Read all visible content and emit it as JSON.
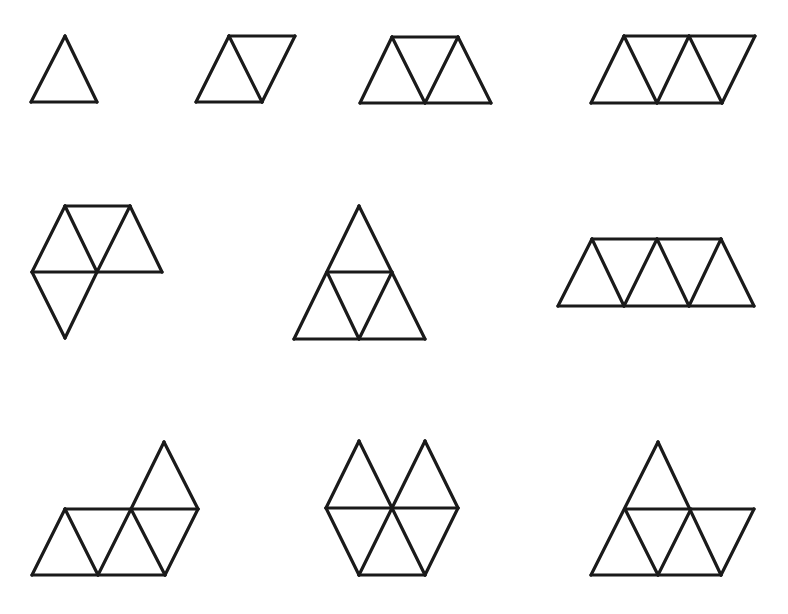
{
  "canvas": {
    "width": 788,
    "height": 614,
    "background": "#ffffff",
    "stroke_color": "#1a1a1a"
  },
  "figures": [
    {
      "id": "fig1",
      "label": "1 triangle (monoamond)",
      "triangles": 1,
      "segments": [
        [
          [
            65,
            36
          ],
          [
            97,
            102
          ]
        ],
        [
          [
            97,
            102
          ],
          [
            31,
            102
          ]
        ],
        [
          [
            31,
            102
          ],
          [
            65,
            36
          ]
        ]
      ]
    },
    {
      "id": "fig2",
      "label": "2 triangles (rhombus)",
      "triangles": 2,
      "segments": [
        [
          [
            229,
            36
          ],
          [
            295,
            36
          ]
        ],
        [
          [
            295,
            36
          ],
          [
            262,
            102
          ]
        ],
        [
          [
            262,
            102
          ],
          [
            196,
            102
          ]
        ],
        [
          [
            196,
            102
          ],
          [
            229,
            36
          ]
        ],
        [
          [
            229,
            36
          ],
          [
            262,
            102
          ]
        ]
      ]
    },
    {
      "id": "fig3",
      "label": "3 triangles (trapezoid)",
      "triangles": 3,
      "segments": [
        [
          [
            392,
            37
          ],
          [
            458,
            37
          ]
        ],
        [
          [
            360,
            103
          ],
          [
            491,
            103
          ]
        ],
        [
          [
            360,
            103
          ],
          [
            392,
            37
          ]
        ],
        [
          [
            392,
            37
          ],
          [
            425,
            103
          ]
        ],
        [
          [
            425,
            103
          ],
          [
            458,
            37
          ]
        ],
        [
          [
            458,
            37
          ],
          [
            491,
            103
          ]
        ]
      ]
    },
    {
      "id": "fig4",
      "label": "4 triangles (parallelogram)",
      "triangles": 4,
      "segments": [
        [
          [
            624,
            36
          ],
          [
            755,
            36
          ]
        ],
        [
          [
            591,
            103
          ],
          [
            722,
            103
          ]
        ],
        [
          [
            591,
            103
          ],
          [
            624,
            36
          ]
        ],
        [
          [
            624,
            36
          ],
          [
            657,
            103
          ]
        ],
        [
          [
            657,
            103
          ],
          [
            689,
            36
          ]
        ],
        [
          [
            689,
            36
          ],
          [
            722,
            103
          ]
        ],
        [
          [
            722,
            103
          ],
          [
            755,
            36
          ]
        ]
      ]
    },
    {
      "id": "fig5",
      "label": "4 triangles (bent)",
      "triangles": 4,
      "segments": [
        [
          [
            65,
            206
          ],
          [
            130,
            206
          ]
        ],
        [
          [
            32,
            272
          ],
          [
            162,
            272
          ]
        ],
        [
          [
            32,
            272
          ],
          [
            65,
            206
          ]
        ],
        [
          [
            65,
            206
          ],
          [
            97,
            272
          ]
        ],
        [
          [
            97,
            272
          ],
          [
            130,
            206
          ]
        ],
        [
          [
            130,
            206
          ],
          [
            162,
            272
          ]
        ],
        [
          [
            32,
            272
          ],
          [
            65,
            338
          ]
        ],
        [
          [
            65,
            338
          ],
          [
            97,
            272
          ]
        ]
      ]
    },
    {
      "id": "fig6",
      "label": "4 triangles (large triangle)",
      "triangles": 4,
      "segments": [
        [
          [
            359,
            206
          ],
          [
            294,
            339
          ]
        ],
        [
          [
            359,
            206
          ],
          [
            425,
            339
          ]
        ],
        [
          [
            294,
            339
          ],
          [
            425,
            339
          ]
        ],
        [
          [
            327,
            272
          ],
          [
            392,
            272
          ]
        ],
        [
          [
            327,
            272
          ],
          [
            359,
            339
          ]
        ],
        [
          [
            359,
            339
          ],
          [
            392,
            272
          ]
        ]
      ]
    },
    {
      "id": "fig7",
      "label": "5 triangles (long trapezoid)",
      "triangles": 5,
      "segments": [
        [
          [
            592,
            239
          ],
          [
            721,
            239
          ]
        ],
        [
          [
            558,
            306
          ],
          [
            754,
            306
          ]
        ],
        [
          [
            558,
            306
          ],
          [
            592,
            239
          ]
        ],
        [
          [
            592,
            239
          ],
          [
            624,
            306
          ]
        ],
        [
          [
            624,
            306
          ],
          [
            657,
            239
          ]
        ],
        [
          [
            657,
            239
          ],
          [
            689,
            306
          ]
        ],
        [
          [
            689,
            306
          ],
          [
            721,
            239
          ]
        ],
        [
          [
            721,
            239
          ],
          [
            754,
            306
          ]
        ]
      ]
    },
    {
      "id": "fig8",
      "label": "5 triangles (stepped)",
      "triangles": 5,
      "segments": [
        [
          [
            65,
            509
          ],
          [
            198,
            509
          ]
        ],
        [
          [
            32,
            575
          ],
          [
            165,
            575
          ]
        ],
        [
          [
            32,
            575
          ],
          [
            65,
            509
          ]
        ],
        [
          [
            65,
            509
          ],
          [
            98,
            575
          ]
        ],
        [
          [
            98,
            575
          ],
          [
            131,
            509
          ]
        ],
        [
          [
            131,
            509
          ],
          [
            165,
            575
          ]
        ],
        [
          [
            165,
            575
          ],
          [
            198,
            509
          ]
        ],
        [
          [
            131,
            509
          ],
          [
            164,
            442
          ]
        ],
        [
          [
            164,
            442
          ],
          [
            198,
            509
          ]
        ]
      ]
    },
    {
      "id": "fig9",
      "label": "6 triangles (hexagon-like)",
      "triangles": 6,
      "segments": [
        [
          [
            359,
            441
          ],
          [
            326,
            508
          ]
        ],
        [
          [
            359,
            441
          ],
          [
            392,
            508
          ]
        ],
        [
          [
            425,
            441
          ],
          [
            392,
            508
          ]
        ],
        [
          [
            425,
            441
          ],
          [
            458,
            508
          ]
        ],
        [
          [
            326,
            508
          ],
          [
            458,
            508
          ]
        ],
        [
          [
            326,
            508
          ],
          [
            359,
            575
          ]
        ],
        [
          [
            359,
            575
          ],
          [
            425,
            575
          ]
        ],
        [
          [
            425,
            575
          ],
          [
            458,
            508
          ]
        ],
        [
          [
            359,
            575
          ],
          [
            392,
            508
          ]
        ],
        [
          [
            392,
            508
          ],
          [
            425,
            575
          ]
        ]
      ]
    },
    {
      "id": "fig10",
      "label": "5 triangles (triangle + extension)",
      "triangles": 5,
      "segments": [
        [
          [
            658,
            442
          ],
          [
            591,
            575
          ]
        ],
        [
          [
            658,
            442
          ],
          [
            721,
            575
          ]
        ],
        [
          [
            625,
            509
          ],
          [
            754,
            509
          ]
        ],
        [
          [
            591,
            575
          ],
          [
            721,
            575
          ]
        ],
        [
          [
            754,
            509
          ],
          [
            721,
            575
          ]
        ],
        [
          [
            625,
            509
          ],
          [
            658,
            575
          ]
        ],
        [
          [
            658,
            575
          ],
          [
            691,
            509
          ]
        ]
      ]
    }
  ]
}
